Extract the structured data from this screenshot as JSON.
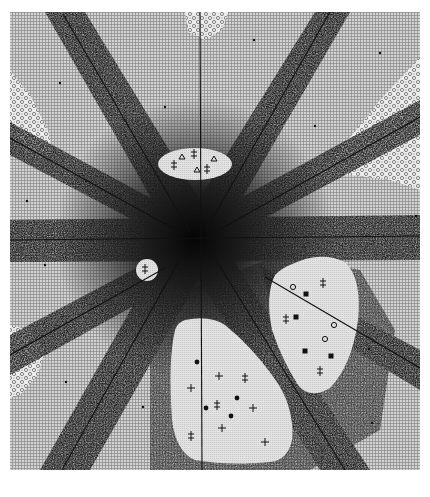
{
  "figure": {
    "type": "scanned halftone diagram",
    "frame": {
      "x": 10,
      "y": 12,
      "width": 410,
      "height": 458
    },
    "center": {
      "x": 195,
      "y": 238
    },
    "colors": {
      "paper": "#ffffff",
      "grid_background": "#c8c8c8",
      "stipple_dark": "#2a2a2a",
      "clear_region": "#dedede",
      "speckle_region": "#e6e6e6",
      "ink": "#111111"
    },
    "lines": [
      {
        "name": "horizontal",
        "x1": 10,
        "y1": 240,
        "x2": 420,
        "y2": 236
      },
      {
        "name": "vertical",
        "x1": 200,
        "y1": 12,
        "x2": 202,
        "y2": 470
      },
      {
        "name": "upper-left-diagonal",
        "x1": 63,
        "y1": 14,
        "x2": 190,
        "y2": 232
      },
      {
        "name": "upper-right-diagonal",
        "x1": 330,
        "y1": 12,
        "x2": 205,
        "y2": 232
      },
      {
        "name": "left-shallow",
        "x1": 10,
        "y1": 138,
        "x2": 185,
        "y2": 235
      },
      {
        "name": "right-shallow",
        "x1": 420,
        "y1": 117,
        "x2": 215,
        "y2": 232
      },
      {
        "name": "lower-left-diagonal",
        "x1": 62,
        "y1": 470,
        "x2": 185,
        "y2": 250
      },
      {
        "name": "lower-right-diagonal",
        "x1": 345,
        "y1": 470,
        "x2": 210,
        "y2": 250
      },
      {
        "name": "lower-left-shallow",
        "x1": 10,
        "y1": 355,
        "x2": 165,
        "y2": 268
      },
      {
        "name": "lower-right-shallow",
        "x1": 420,
        "y1": 368,
        "x2": 265,
        "y2": 277
      }
    ],
    "clear_regions": [
      {
        "name": "top-ellipse",
        "cx": 195,
        "cy": 164,
        "rx": 37,
        "ry": 16
      },
      {
        "name": "small-left-circle",
        "cx": 147,
        "cy": 270,
        "rx": 11,
        "ry": 11
      },
      {
        "name": "right-blob"
      },
      {
        "name": "bottom-blob"
      }
    ],
    "speckle_regions": [
      {
        "name": "top-center-patch"
      },
      {
        "name": "left-patch"
      },
      {
        "name": "right-wedge"
      },
      {
        "name": "lower-left-patch"
      }
    ],
    "markers": [
      {
        "shape": "double-cross",
        "x": 174,
        "y": 165
      },
      {
        "shape": "triangle",
        "x": 182,
        "y": 157
      },
      {
        "shape": "double-cross",
        "x": 194,
        "y": 154
      },
      {
        "shape": "triangle",
        "x": 214,
        "y": 159
      },
      {
        "shape": "triangle",
        "x": 197,
        "y": 170
      },
      {
        "shape": "double-cross",
        "x": 207,
        "y": 169
      },
      {
        "shape": "double-cross",
        "x": 145,
        "y": 269
      },
      {
        "shape": "open-circle",
        "x": 293,
        "y": 287
      },
      {
        "shape": "filled-square",
        "x": 306,
        "y": 294
      },
      {
        "shape": "double-cross",
        "x": 323,
        "y": 283
      },
      {
        "shape": "double-cross",
        "x": 286,
        "y": 319
      },
      {
        "shape": "filled-square",
        "x": 296,
        "y": 317
      },
      {
        "shape": "open-circle",
        "x": 334,
        "y": 325
      },
      {
        "shape": "open-circle",
        "x": 325,
        "y": 339
      },
      {
        "shape": "filled-square",
        "x": 305,
        "y": 351
      },
      {
        "shape": "filled-square",
        "x": 331,
        "y": 356
      },
      {
        "shape": "double-cross",
        "x": 320,
        "y": 371
      },
      {
        "shape": "filled-circle",
        "x": 197,
        "y": 362
      },
      {
        "shape": "cross",
        "x": 219,
        "y": 376
      },
      {
        "shape": "double-cross",
        "x": 245,
        "y": 378
      },
      {
        "shape": "cross",
        "x": 191,
        "y": 388
      },
      {
        "shape": "double-cross",
        "x": 217,
        "y": 405
      },
      {
        "shape": "filled-circle",
        "x": 237,
        "y": 398
      },
      {
        "shape": "filled-circle",
        "x": 206,
        "y": 408
      },
      {
        "shape": "cross",
        "x": 253,
        "y": 408
      },
      {
        "shape": "filled-circle",
        "x": 231,
        "y": 416
      },
      {
        "shape": "cross",
        "x": 222,
        "y": 428
      },
      {
        "shape": "double-cross",
        "x": 191,
        "y": 436
      },
      {
        "shape": "cross",
        "x": 265,
        "y": 442
      }
    ],
    "scattered_dots": [
      {
        "x": 60,
        "y": 83
      },
      {
        "x": 165,
        "y": 107
      },
      {
        "x": 254,
        "y": 40
      },
      {
        "x": 380,
        "y": 53
      },
      {
        "x": 315,
        "y": 126
      },
      {
        "x": 27,
        "y": 201
      },
      {
        "x": 45,
        "y": 265
      },
      {
        "x": 66,
        "y": 382
      },
      {
        "x": 143,
        "y": 407
      },
      {
        "x": 372,
        "y": 423
      },
      {
        "x": 369,
        "y": 349
      },
      {
        "x": 416,
        "y": 216
      }
    ]
  }
}
